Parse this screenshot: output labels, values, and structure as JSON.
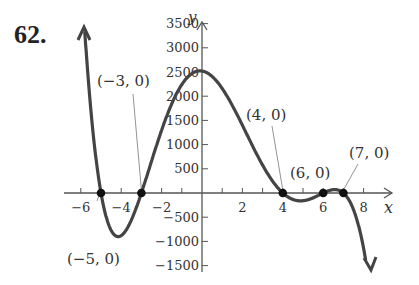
{
  "problem": {
    "number": "62."
  },
  "chart_data": {
    "type": "line",
    "title": "",
    "xlabel": "x",
    "ylabel": "y",
    "xlim": [
      -7,
      9
    ],
    "ylim": [
      -1900,
      3900
    ],
    "x_ticks": [
      -6,
      -5,
      -4,
      -3,
      -2,
      -1,
      1,
      2,
      3,
      4,
      5,
      6,
      7,
      8
    ],
    "x_tick_labels": [
      "-6",
      "-4",
      "-2",
      "2",
      "4",
      "6",
      "8"
    ],
    "x_tick_label_values": [
      -6,
      -4,
      -2,
      2,
      4,
      6,
      8
    ],
    "y_ticks": [
      -1500,
      -1000,
      -500,
      500,
      1000,
      1500,
      2000,
      2500,
      3000,
      3500
    ],
    "y_tick_labels": [
      "-1500",
      "-1000",
      "-500",
      "500",
      "1000",
      "1500",
      "2000",
      "2500",
      "3000",
      "3500"
    ],
    "grid": false,
    "series": [
      {
        "name": "polynomial",
        "function": "-(x+5)(x+3)(x-4)(x-6)(x-7)",
        "color": "#444444"
      }
    ],
    "points": [
      {
        "x": -5,
        "y": 0,
        "label": "(−5, 0)"
      },
      {
        "x": -3,
        "y": 0,
        "label": "(−3, 0)"
      },
      {
        "x": 4,
        "y": 0,
        "label": "(4, 0)"
      },
      {
        "x": 6,
        "y": 0,
        "label": "(6, 0)"
      },
      {
        "x": 7,
        "y": 0,
        "label": "(7, 0)"
      }
    ],
    "features": {
      "y_intercept": 2520,
      "local_min_near": [
        -4.1,
        -870
      ],
      "local_max_near": [
        0.1,
        2525
      ]
    }
  }
}
